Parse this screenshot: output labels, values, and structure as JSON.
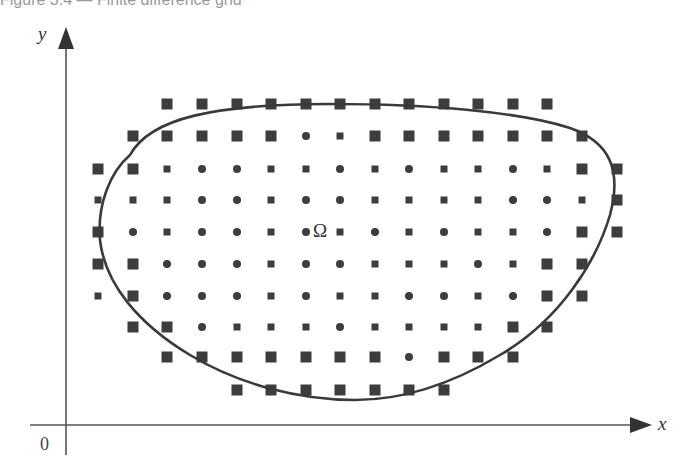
{
  "caption": "Figure 3.4 — Finite difference grid",
  "axes": {
    "x_label": "x",
    "y_label": "y",
    "origin_label": "0"
  },
  "domain_label": "Ω",
  "colors": {
    "ink": "#3a3a3a",
    "axis": "#555555",
    "point": "#3d3d3d"
  },
  "grid": {
    "columns_x": [
      98,
      133,
      167,
      202,
      237,
      271,
      306,
      340,
      375,
      409,
      444,
      478,
      513,
      547,
      582,
      617
    ],
    "rows_y": [
      104,
      136,
      169,
      200,
      232,
      264,
      296,
      327,
      357,
      390
    ],
    "legend": {
      "L": "boundary-adjacent point (large square)",
      "s": "interior point (small square)",
      "c": "interior point (circle)"
    },
    "rows": [
      [
        "-",
        "-",
        "L",
        "L",
        "L",
        "L",
        "L",
        "L",
        "L",
        "L",
        "L",
        "L",
        "L",
        "L",
        "-",
        "-"
      ],
      [
        "-",
        "L",
        "L",
        "L",
        "L",
        "L",
        "c",
        "s",
        "L",
        "L",
        "L",
        "L",
        "L",
        "L",
        "L",
        "-"
      ],
      [
        "L",
        "L",
        "s",
        "c",
        "c",
        "s",
        "s",
        "c",
        "s",
        "c",
        "s",
        "s",
        "c",
        "s",
        "L",
        "L"
      ],
      [
        "s",
        "s",
        "s",
        "c",
        "c",
        "s",
        "c",
        "c",
        "s",
        "s",
        "s",
        "s",
        "c",
        "c",
        "s",
        "L"
      ],
      [
        "L",
        "c",
        "s",
        "c",
        "c",
        "s",
        "c",
        "s",
        "c",
        "s",
        "c",
        "s",
        "s",
        "c",
        "L",
        "L"
      ],
      [
        "L",
        "L",
        "c",
        "c",
        "c",
        "s",
        "c",
        "c",
        "s",
        "s",
        "s",
        "c",
        "s",
        "L",
        "L",
        "-"
      ],
      [
        "s",
        "L",
        "c",
        "c",
        "c",
        "s",
        "c",
        "s",
        "s",
        "c",
        "c",
        "s",
        "c",
        "L",
        "L",
        "-"
      ],
      [
        "-",
        "L",
        "L",
        "c",
        "s",
        "s",
        "s",
        "c",
        "s",
        "s",
        "s",
        "s",
        "L",
        "L",
        "-",
        "-"
      ],
      [
        "-",
        "-",
        "L",
        "L",
        "L",
        "L",
        "L",
        "L",
        "L",
        "c",
        "L",
        "L",
        "L",
        "-",
        "-",
        "-"
      ],
      [
        "-",
        "-",
        "-",
        "-",
        "L",
        "L",
        "L",
        "L",
        "L",
        "L",
        "L",
        "-",
        "-",
        "-",
        "-",
        "-"
      ]
    ]
  },
  "boundary_path": "M 130 155 C 150 118, 215 104, 330 104 C 430 104, 520 112, 570 128 C 610 142, 622 170, 610 215 C 596 262, 560 320, 500 355 C 450 385, 400 400, 355 400 C 300 400, 240 385, 190 355 C 140 325, 105 285, 100 240 C 97 205, 110 172, 130 155 Z"
}
